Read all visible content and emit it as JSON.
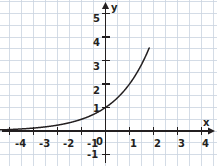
{
  "figure": {
    "background": "#ffffff",
    "grid_color": "#c9d3e0",
    "axis_color": "#231f20",
    "curve_color": "#231f20",
    "width": 217,
    "height": 166
  },
  "axes": {
    "x_label": "x",
    "y_label": "y",
    "origin_label": "0",
    "x_ticks": [
      {
        "value": -4,
        "label": "-4"
      },
      {
        "value": -3,
        "label": "-3"
      },
      {
        "value": -2,
        "label": "-2"
      },
      {
        "value": -1,
        "label": "-1"
      },
      {
        "value": 1,
        "label": "1"
      },
      {
        "value": 2,
        "label": "2"
      },
      {
        "value": 3,
        "label": "3"
      },
      {
        "value": 4,
        "label": "4"
      }
    ],
    "y_ticks": [
      {
        "value": 5,
        "label": "5"
      },
      {
        "value": 4,
        "label": "4"
      },
      {
        "value": 3,
        "label": "3"
      },
      {
        "value": 2,
        "label": "2"
      },
      {
        "value": 1,
        "label": "1"
      },
      {
        "value": -1,
        "label": "-1"
      }
    ]
  },
  "chart_data": {
    "type": "line",
    "title": "",
    "xlabel": "x",
    "ylabel": "y",
    "xlim": [
      -4.4,
      4.4
    ],
    "ylim": [
      -1.4,
      5.8
    ],
    "grid": true,
    "grid_step": 0.5,
    "legend": "none",
    "series": [
      {
        "name": "y = 2^x",
        "equation": "y = 2^x",
        "x": [
          -4.4,
          -4.0,
          -3.5,
          -3.0,
          -2.5,
          -2.0,
          -1.5,
          -1.0,
          -0.5,
          0.0,
          0.5,
          1.0,
          1.25,
          1.5,
          1.75,
          1.8
        ],
        "y": [
          0.047,
          0.063,
          0.088,
          0.125,
          0.177,
          0.25,
          0.354,
          0.5,
          0.707,
          1.0,
          1.414,
          2.0,
          2.378,
          2.828,
          3.364,
          3.482
        ]
      }
    ],
    "annotations": [
      {
        "text": "y-intercept at (0, 1)",
        "x": 0,
        "y": 1
      }
    ]
  }
}
